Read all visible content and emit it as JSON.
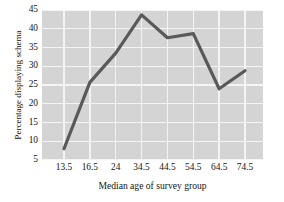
{
  "chart_data": {
    "type": "line",
    "title": "",
    "xlabel": "Median age of survey group",
    "ylabel": "Percentage displaying schema",
    "categories": [
      "13.5",
      "16.5",
      "24",
      "34.5",
      "44.5",
      "54.5",
      "64.5",
      "74.5"
    ],
    "x": [
      13.5,
      16.5,
      24,
      34.5,
      44.5,
      54.5,
      64.5,
      74.5
    ],
    "values": [
      8.0,
      25.7,
      33.5,
      43.7,
      37.6,
      38.7,
      24.0,
      28.8
    ],
    "series": [
      {
        "name": "Percentage displaying schema",
        "values": [
          8.0,
          25.7,
          33.5,
          43.7,
          37.6,
          38.7,
          24.0,
          28.8
        ]
      }
    ],
    "ylim": [
      5,
      45
    ],
    "yticks": [
      5,
      10,
      15,
      20,
      25,
      30,
      35,
      40,
      45
    ],
    "ytick_labels": [
      "5",
      "10",
      "15",
      "20",
      "25",
      "30",
      "35",
      "40",
      "45"
    ],
    "grid": true,
    "legend": false,
    "legend_position": "none",
    "line_color": "#595959",
    "plot_background": "#d4d4d4",
    "grid_color": "#f4f4f4"
  }
}
